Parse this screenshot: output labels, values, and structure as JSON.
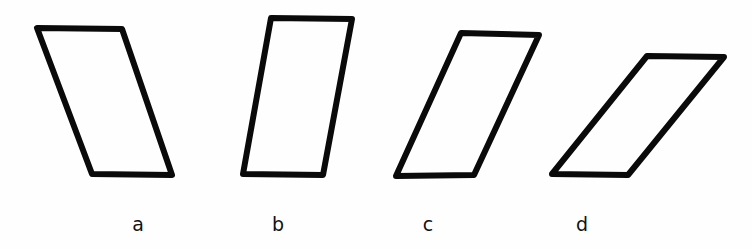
{
  "figure": {
    "background": "#ffffff",
    "stroke_color": "#0a0a0a",
    "shapes": [
      {
        "id": "a",
        "label": "a",
        "type": "parallelogram",
        "lean": "right-leaning-down (top shifted left)",
        "points": [
          [
            37,
            28
          ],
          [
            122,
            29
          ],
          [
            172,
            175
          ],
          [
            92,
            174
          ]
        ],
        "label_x": 138
      },
      {
        "id": "b",
        "label": "b",
        "type": "parallelogram",
        "lean": "slight left tilt (top shifted right)",
        "points": [
          [
            271,
            18
          ],
          [
            352,
            19
          ],
          [
            323,
            175
          ],
          [
            243,
            174
          ]
        ],
        "label_x": 278
      },
      {
        "id": "c",
        "label": "c",
        "type": "parallelogram",
        "lean": "moderate left tilt (top shifted right)",
        "points": [
          [
            461,
            33
          ],
          [
            539,
            35
          ],
          [
            474,
            175
          ],
          [
            396,
            176
          ]
        ],
        "label_x": 428
      },
      {
        "id": "d",
        "label": "d",
        "type": "parallelogram",
        "lean": "strong left tilt (top shifted right)",
        "points": [
          [
            647,
            56
          ],
          [
            724,
            57
          ],
          [
            628,
            175
          ],
          [
            552,
            174
          ]
        ],
        "label_x": 582
      }
    ]
  }
}
